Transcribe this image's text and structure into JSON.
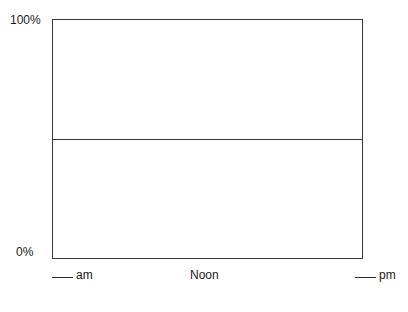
{
  "chart_data": {
    "type": "line",
    "title": "",
    "xlabel": "",
    "ylabel": "",
    "ylim": [
      0,
      100
    ],
    "y_ticks": [
      "100%",
      "0%"
    ],
    "x_ticks": [
      "___ am",
      "Noon",
      "___ pm"
    ],
    "reference_lines": [
      {
        "orientation": "horizontal",
        "y": 50
      }
    ],
    "series": [],
    "grid": false,
    "legend": null
  },
  "axis": {
    "y_top_label": "100%",
    "y_bottom_label": "0%",
    "x_left_label": "am",
    "x_center_label": "Noon",
    "x_right_label": "pm"
  },
  "colors": {
    "frame": "#3a3a3a",
    "text": "#1a1a1a",
    "background": "#ffffff"
  }
}
